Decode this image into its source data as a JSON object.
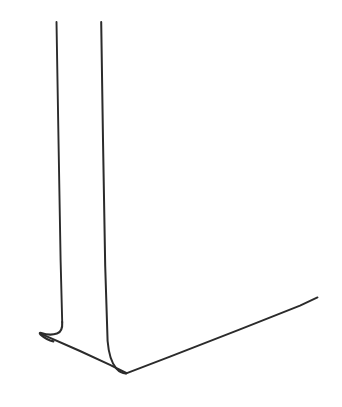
{
  "canvas": {
    "width": 342,
    "height": 407,
    "background_color": "#ffffff",
    "title": "Line drawing sketch"
  },
  "drawing": {
    "name": "two-legged-form-with-hooked-foot",
    "description": "Minimal black ink line drawing: two tall near-vertical lines descending to a hooked foot at lower left and a V-shaped base extending to the lower right.",
    "stroke_color": "#2b2b2b",
    "stroke_color_light": "#3a3a3a",
    "stroke_width": 2.0,
    "stroke_width_thin": 1.7,
    "strokes": [
      {
        "name": "left-vertical-line",
        "path": "M 56.5 22 L 58.5 140 L 60.6 260 L 62.2 322"
      },
      {
        "name": "left-foot-hook",
        "path": "M 62.2 322 C 62.6 328.5 61.4 332.2 57.0 333.6 C 52.0 335.2 46.0 334.6 41.2 333.0 C 39.6 332.5 39.2 333.4 40.6 334.6 C 45.0 338.4 49.6 340.6 53.4 341.4"
      },
      {
        "name": "base-line-left-to-vertex",
        "path": "M 41.6 334.2 L 80.0 351.0 L 110.0 364.8 L 126.2 373.0"
      },
      {
        "name": "right-vertical-line",
        "path": "M 101.2 22 L 103.0 140 L 105.2 266 L 107.6 341 C 108.6 353.0 111.0 362.4 116.4 368.6 C 119.6 372.2 123.0 373.6 126.2 373.4"
      },
      {
        "name": "base-line-vertex-to-right-tip",
        "path": "M 126.2 373.4 L 170.0 356.6 L 240.0 329.4 L 300.0 305.6 L 317.5 297.4"
      }
    ],
    "key_points": [
      {
        "name": "left-line-top",
        "x": 56.5,
        "y": 22
      },
      {
        "name": "right-line-top",
        "x": 101.2,
        "y": 22
      },
      {
        "name": "hook-leftmost",
        "x": 40.0,
        "y": 333.5
      },
      {
        "name": "base-vertex",
        "x": 126.2,
        "y": 373.0
      },
      {
        "name": "base-right-tip",
        "x": 317.5,
        "y": 297.4
      }
    ]
  }
}
